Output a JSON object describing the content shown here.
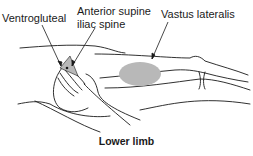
{
  "labels": {
    "ventrogluteal": "Ventrogluteal",
    "anterior_spine_line1": "Anterior supine",
    "anterior_spine_line2": "iliac spine",
    "vastus_lateralis": "Vastus lateralis"
  },
  "caption": "Lower limb",
  "colors": {
    "stroke": "#1a1a1a",
    "shaded_region": "#b8b8b8"
  }
}
